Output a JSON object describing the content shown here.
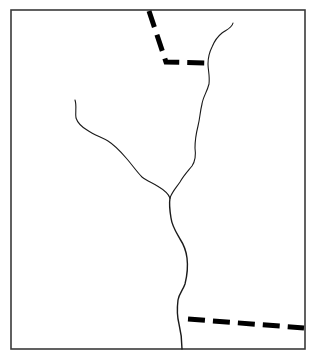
{
  "map": {
    "title": "",
    "colors": {
      "background": "#ffffff",
      "frame": "#3a3a3a",
      "river": "#1a1a1a",
      "boundary": "#000000"
    },
    "features": [
      {
        "id": "river-right-tributary",
        "kind": "river",
        "style": "solid-thin"
      },
      {
        "id": "river-left-tributary",
        "kind": "river",
        "style": "solid-thin"
      },
      {
        "id": "river-main-stem",
        "kind": "river",
        "style": "solid"
      },
      {
        "id": "boundary-north",
        "kind": "boundary",
        "style": "dashed-bold"
      },
      {
        "id": "boundary-southeast",
        "kind": "boundary",
        "style": "dashed-bold"
      },
      {
        "id": "confluence",
        "kind": "junction"
      }
    ],
    "labels": []
  }
}
